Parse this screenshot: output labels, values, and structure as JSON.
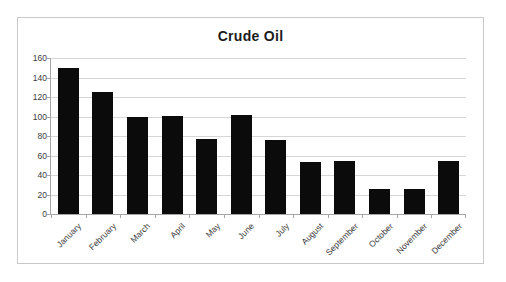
{
  "chart_data": {
    "type": "bar",
    "title": "Crude Oil",
    "xlabel": "",
    "ylabel": "",
    "categories": [
      "January",
      "February",
      "March",
      "April",
      "May",
      "June",
      "July",
      "August",
      "September",
      "October",
      "November",
      "December"
    ],
    "values": [
      150,
      125,
      100,
      101,
      77,
      102,
      76,
      53,
      54,
      26,
      26,
      54
    ],
    "ylim": [
      0,
      160
    ],
    "ytick_labels": [
      "0",
      "20",
      "40",
      "60",
      "80",
      "100",
      "120",
      "140",
      "160"
    ],
    "ytick_values": [
      0,
      20,
      40,
      60,
      80,
      100,
      120,
      140,
      160
    ],
    "ystep": 20,
    "grid": true,
    "legend": false,
    "legend_position": "none",
    "series": [
      {
        "name": "Crude Oil",
        "color": "#0b0b0b",
        "values": [
          150,
          125,
          100,
          101,
          77,
          102,
          76,
          53,
          54,
          26,
          26,
          54
        ]
      }
    ],
    "colors": {
      "bar": "#0b0b0b",
      "gridline": "#d6d6d6",
      "axis": "#a6a6a6",
      "text": "#3b3b3b",
      "title": "#1c1c1c",
      "frame": "#c9c9c9",
      "background": "#ffffff"
    }
  }
}
